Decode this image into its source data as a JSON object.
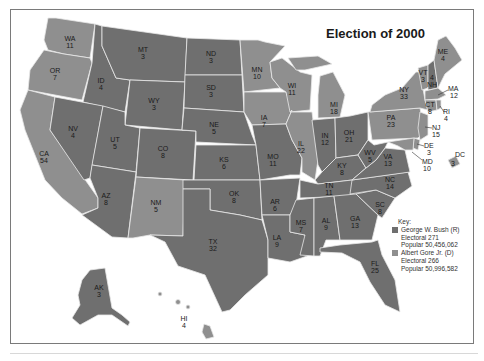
{
  "title": "Election of 2000",
  "colors": {
    "bush": "#6f6f6f",
    "gore": "#8f8f8f",
    "border": "#e8e8e8",
    "frame": "#7a7a7a"
  },
  "key": {
    "heading": "Key:",
    "entries": [
      {
        "candidate": "George W. Bush (R)",
        "electoral": "Electoral 271",
        "popular": "Popular 50,456,062",
        "color": "#6f6f6f"
      },
      {
        "candidate": "Albert Gore Jr. (D)",
        "electoral": "Electoral 266",
        "popular": "Popular 50,996,582",
        "color": "#8f8f8f"
      }
    ]
  },
  "states": {
    "WA": {
      "abbr": "WA",
      "ev": "11",
      "winner": "gore"
    },
    "OR": {
      "abbr": "OR",
      "ev": "7",
      "winner": "gore"
    },
    "CA": {
      "abbr": "CA",
      "ev": "54",
      "winner": "gore"
    },
    "ID": {
      "abbr": "ID",
      "ev": "4",
      "winner": "bush"
    },
    "NV": {
      "abbr": "NV",
      "ev": "4",
      "winner": "bush"
    },
    "MT": {
      "abbr": "MT",
      "ev": "3",
      "winner": "bush"
    },
    "WY": {
      "abbr": "WY",
      "ev": "3",
      "winner": "bush"
    },
    "UT": {
      "abbr": "UT",
      "ev": "5",
      "winner": "bush"
    },
    "CO": {
      "abbr": "CO",
      "ev": "8",
      "winner": "bush"
    },
    "AZ": {
      "abbr": "AZ",
      "ev": "8",
      "winner": "bush"
    },
    "NM": {
      "abbr": "NM",
      "ev": "5",
      "winner": "gore"
    },
    "ND": {
      "abbr": "ND",
      "ev": "3",
      "winner": "bush"
    },
    "SD": {
      "abbr": "SD",
      "ev": "3",
      "winner": "bush"
    },
    "NE": {
      "abbr": "NE",
      "ev": "5",
      "winner": "bush"
    },
    "KS": {
      "abbr": "KS",
      "ev": "6",
      "winner": "bush"
    },
    "OK": {
      "abbr": "OK",
      "ev": "8",
      "winner": "bush"
    },
    "TX": {
      "abbr": "TX",
      "ev": "32",
      "winner": "bush"
    },
    "MN": {
      "abbr": "MN",
      "ev": "10",
      "winner": "gore"
    },
    "IA": {
      "abbr": "IA",
      "ev": "7",
      "winner": "gore"
    },
    "MO": {
      "abbr": "MO",
      "ev": "11",
      "winner": "bush"
    },
    "AR": {
      "abbr": "AR",
      "ev": "6",
      "winner": "bush"
    },
    "LA": {
      "abbr": "LA",
      "ev": "9",
      "winner": "bush"
    },
    "WI": {
      "abbr": "WI",
      "ev": "11",
      "winner": "gore"
    },
    "IL": {
      "abbr": "IL",
      "ev": "22",
      "winner": "gore"
    },
    "MI": {
      "abbr": "MI",
      "ev": "18",
      "winner": "gore"
    },
    "IN": {
      "abbr": "IN",
      "ev": "12",
      "winner": "bush"
    },
    "OH": {
      "abbr": "OH",
      "ev": "21",
      "winner": "bush"
    },
    "KY": {
      "abbr": "KY",
      "ev": "8",
      "winner": "bush"
    },
    "TN": {
      "abbr": "TN",
      "ev": "11",
      "winner": "bush"
    },
    "MS": {
      "abbr": "MS",
      "ev": "7",
      "winner": "bush"
    },
    "AL": {
      "abbr": "AL",
      "ev": "9",
      "winner": "bush"
    },
    "GA": {
      "abbr": "GA",
      "ev": "13",
      "winner": "bush"
    },
    "FL": {
      "abbr": "FL",
      "ev": "25",
      "winner": "bush"
    },
    "SC": {
      "abbr": "SC",
      "ev": "8",
      "winner": "bush"
    },
    "NC": {
      "abbr": "NC",
      "ev": "14",
      "winner": "bush"
    },
    "VA": {
      "abbr": "VA",
      "ev": "13",
      "winner": "bush"
    },
    "WV": {
      "abbr": "WV",
      "ev": "5",
      "winner": "bush"
    },
    "PA": {
      "abbr": "PA",
      "ev": "23",
      "winner": "gore"
    },
    "NY": {
      "abbr": "NY",
      "ev": "33",
      "winner": "gore"
    },
    "VT": {
      "abbr": "VT",
      "ev": "3",
      "winner": "gore"
    },
    "NH": {
      "abbr": "NH",
      "ev": "4",
      "winner": "bush"
    },
    "ME": {
      "abbr": "ME",
      "ev": "4",
      "winner": "gore"
    },
    "MA": {
      "abbr": "MA",
      "ev": "12",
      "winner": "gore"
    },
    "RI": {
      "abbr": "RI",
      "ev": "4",
      "winner": "gore"
    },
    "CT": {
      "abbr": "CT",
      "ev": "8",
      "winner": "gore"
    },
    "NJ": {
      "abbr": "NJ",
      "ev": "15",
      "winner": "gore"
    },
    "DE": {
      "abbr": "DE",
      "ev": "3",
      "winner": "gore"
    },
    "MD": {
      "abbr": "MD",
      "ev": "10",
      "winner": "gore"
    },
    "DC": {
      "abbr": "DC",
      "ev": "3",
      "winner": "gore"
    },
    "AK": {
      "abbr": "AK",
      "ev": "3",
      "winner": "bush"
    },
    "HI": {
      "abbr": "HI",
      "ev": "4",
      "winner": "gore"
    }
  }
}
